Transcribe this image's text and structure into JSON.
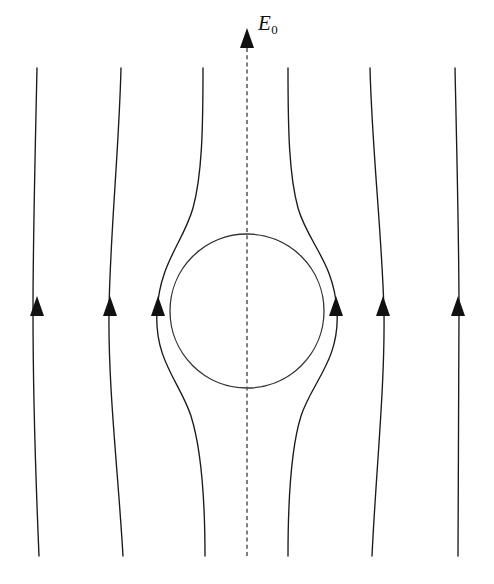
{
  "figure": {
    "background_color": "#ffffff",
    "width": 494,
    "height": 584,
    "label": {
      "symbol": "E",
      "subscript": "0",
      "full_text": "E0",
      "meaning": "uniform applied electric field",
      "x": 258,
      "y": 13
    },
    "axis": {
      "name": "symmetry-axis",
      "style": "dashed",
      "color": "#555555",
      "x": 247,
      "y_top": 48,
      "y_bottom": 556,
      "arrow_tip_y": 28,
      "direction": "up"
    },
    "sphere": {
      "name": "dielectric-sphere",
      "center_x": 247,
      "center_y": 311,
      "radius": 77,
      "stroke_color": "#333333",
      "fill": "none"
    },
    "line_color": "#1a1a1a",
    "arrow_row_y": 311,
    "field_lines": [
      {
        "id": 1,
        "position": "far-left",
        "x_top": 37,
        "x_mid": 33,
        "x_bottom": 39,
        "arrow_x": 37,
        "distortion": "negligible",
        "path": "M 37 68 C 35 160, 33 240, 33 311 C 33 382, 35 462, 39 556"
      },
      {
        "id": 2,
        "position": "left-outer",
        "x_top": 121,
        "x_mid": 108,
        "x_bottom": 123,
        "arrow_x": 110,
        "distortion": "slight outward bow",
        "path": "M 121 68 C 119 150, 110 235, 109 311 C 108 388, 118 470, 123 556"
      },
      {
        "id": 3,
        "position": "left-inner",
        "x_top": 203,
        "x_mid": 157,
        "x_bottom": 205,
        "arrow_x": 158,
        "distortion": "strong, wraps tangentially around sphere",
        "path": "M 203 68 C 203 130, 202 175, 193 208 C 183 243, 160 262, 157 311 C 154 360, 180 382, 191 416 C 201 448, 205 498, 205 556"
      },
      {
        "id": 4,
        "position": "right-inner",
        "x_top": 288,
        "x_mid": 337,
        "x_bottom": 288,
        "arrow_x": 336,
        "distortion": "strong, wraps tangentially around sphere",
        "path": "M 288 68 C 288 130, 289 175, 298 208 C 308 243, 334 262, 337 311 C 340 360, 312 382, 301 416 C 291 448, 288 498, 288 556"
      },
      {
        "id": 5,
        "position": "right-outer",
        "x_top": 370,
        "x_mid": 384,
        "x_bottom": 372,
        "arrow_x": 383,
        "distortion": "slight outward bow",
        "path": "M 370 68 C 372 150, 382 235, 384 311 C 385 388, 376 470, 372 556"
      },
      {
        "id": 6,
        "position": "far-right",
        "x_top": 455,
        "x_mid": 459,
        "x_bottom": 458,
        "arrow_x": 458,
        "distortion": "negligible",
        "path": "M 455 68 C 457 160, 459 240, 459 311 C 459 382, 458 462, 458 556"
      }
    ],
    "arrow_count": 7,
    "arrow_note": "six field-line arrowheads at the sphere equator height plus one on the dashed axis at top"
  }
}
